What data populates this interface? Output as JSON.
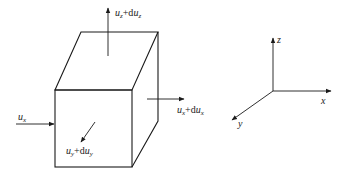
{
  "diagram": {
    "type": "fluid element velocity components",
    "colors": {
      "line": "#1a1a1a",
      "background": "#ffffff"
    },
    "cube": {
      "front_face": {
        "left": 55,
        "top": 90,
        "right": 132,
        "bottom": 167
      },
      "depth_offset": {
        "dx": 26,
        "dy": -58
      }
    },
    "arrows": {
      "top": {
        "base": "u",
        "sub": "z",
        "plus": "+d",
        "base2": "u",
        "sub2": "z"
      },
      "right": {
        "base": "u",
        "sub": "x",
        "plus": "+d",
        "base2": "u",
        "sub2": "x"
      },
      "left": {
        "base": "u",
        "sub": "x"
      },
      "front": {
        "base": "u",
        "sub": "y",
        "plus": "+d",
        "base2": "u",
        "sub2": "y"
      }
    },
    "axes": {
      "z_label": "z",
      "x_label": "x",
      "y_label": "y"
    }
  }
}
